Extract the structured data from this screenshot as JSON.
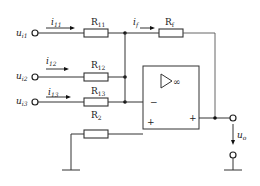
{
  "diagram": {
    "type": "circuit",
    "inputs": [
      {
        "voltage": "u",
        "voltage_sub": "i1",
        "current": "i",
        "current_sub": "11",
        "resistor": "R",
        "resistor_sub": "11"
      },
      {
        "voltage": "u",
        "voltage_sub": "i2",
        "current": "i",
        "current_sub": "12",
        "resistor": "R",
        "resistor_sub": "12"
      },
      {
        "voltage": "u",
        "voltage_sub": "i3",
        "current": "i",
        "current_sub": "13",
        "resistor": "R",
        "resistor_sub": "13"
      }
    ],
    "feedback": {
      "current": "i",
      "current_sub": "f",
      "resistor": "R",
      "resistor_sub": "f"
    },
    "balance_resistor": {
      "resistor": "R",
      "resistor_sub": "2"
    },
    "opamp": {
      "symbol": "▷∞",
      "minus": "−",
      "plus_in": "+",
      "plus_out": "+"
    },
    "output": {
      "voltage": "u",
      "voltage_sub": "o"
    }
  }
}
